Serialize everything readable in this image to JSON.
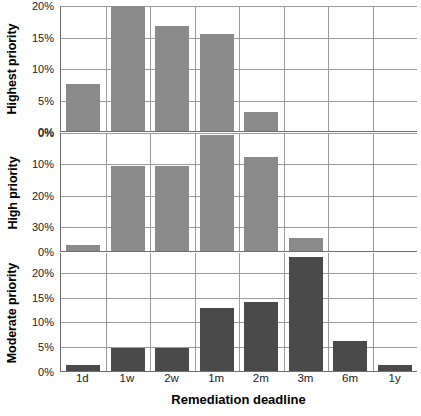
{
  "chart_data": {
    "type": "bar",
    "title": "",
    "xlabel": "Remediation deadline",
    "categories": [
      "1d",
      "1w",
      "2w",
      "1m",
      "2m",
      "3m",
      "6m",
      "1y"
    ],
    "grid": true,
    "legend": "none",
    "panels": [
      {
        "ylabel": "Highest priority",
        "bar_color": "#8a8a8a",
        "ylim": [
          0,
          20
        ],
        "inverted": false,
        "yticks": [
          0,
          5,
          10,
          15,
          20
        ],
        "yticklabels": [
          "0%",
          "5%",
          "10%",
          "15%",
          "20%"
        ],
        "values": [
          7.5,
          20.0,
          16.7,
          15.4,
          3.0,
          0,
          0,
          0
        ]
      },
      {
        "ylabel": "High priority",
        "bar_color": "#8a8a8a",
        "ylim": [
          0,
          38
        ],
        "inverted": true,
        "yticks": [
          0,
          10,
          20,
          30
        ],
        "yticklabels": [
          "0%",
          "10%",
          "20%",
          "30%"
        ],
        "baseline_label": "0%",
        "values": [
          2.0,
          27.0,
          27.0,
          37.0,
          30.0,
          4.0,
          0,
          0
        ]
      },
      {
        "ylabel": "Moderate priority",
        "bar_color": "#4a4a4a",
        "ylim": [
          0,
          24
        ],
        "inverted": false,
        "yticks": [
          0,
          5,
          10,
          15,
          20
        ],
        "yticklabels": [
          "0%",
          "5%",
          "10%",
          "15%",
          "20%"
        ],
        "values": [
          1.3,
          4.6,
          4.6,
          12.8,
          14.0,
          23.0,
          6.0,
          1.3
        ]
      }
    ]
  }
}
